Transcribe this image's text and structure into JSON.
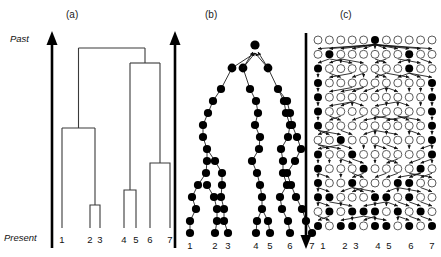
{
  "figure": {
    "background_color": "#ffffff",
    "width": 441,
    "height": 257
  },
  "axis": {
    "past_label": "Past",
    "present_label": "Present",
    "past_icon": "up-arrow-icon",
    "present_icon": "down-arrow-icon"
  },
  "panels": [
    {
      "id": "a",
      "label": "(a)",
      "type": "coalescent-tree",
      "arrow_direction": "up",
      "tip_labels": [
        "1",
        "2",
        "3",
        "4",
        "5",
        "6",
        "7"
      ]
    },
    {
      "id": "b",
      "label": "(b)",
      "type": "discrete-generation-genealogy",
      "arrow_direction": "up",
      "tip_labels": [
        "1",
        "2",
        "3",
        "4",
        "5",
        "6",
        "7"
      ]
    },
    {
      "id": "c",
      "label": "(c)",
      "type": "wright-fisher-population-grid",
      "arrow_direction": "down",
      "tip_labels": [
        "1",
        "2",
        "3",
        "4",
        "5",
        "6",
        "7"
      ],
      "grid_columns": 11,
      "grid_rows": 14
    }
  ],
  "colors": {
    "filled_node": "#000000",
    "open_node_fill": "#ffffff",
    "open_node_stroke": "#4a4a4a",
    "tree_line": "#3a3a3a",
    "axis": "#000000",
    "text": "#111111"
  },
  "chart_data": {
    "type": "diagram",
    "panel_a": {
      "description": "Coalescent tree with 7 sampled lineages drawn with square (rectangular) branches. Vertical axis is time from Present (bottom) to Past (top).",
      "tip_x": [
        62,
        90,
        100,
        124,
        136,
        150,
        170
      ],
      "tip_labels": [
        "1",
        "2",
        "3",
        "4",
        "5",
        "6",
        "7"
      ],
      "tip_y": 228,
      "coalescent_events": [
        {
          "name": "node_23",
          "children_x": [
            90,
            100
          ],
          "y": 205
        },
        {
          "name": "node_1_23",
          "children_x": [
            62,
            95
          ],
          "y": 128
        },
        {
          "name": "node_45",
          "children_x": [
            124,
            136
          ],
          "y": 190
        },
        {
          "name": "node_67",
          "children_x": [
            150,
            170
          ],
          "y": 163
        },
        {
          "name": "node_45_67",
          "children_x": [
            130,
            160
          ],
          "y": 63
        },
        {
          "name": "root",
          "children_x": [
            78.5,
            145
          ],
          "y": 48
        }
      ]
    },
    "panel_b": {
      "description": "Genealogy embedded in discrete generations: filled circles are ancestors of the sample, joined by arrows pointing back in time toward the root.",
      "rows": 14,
      "row_y": [
        40,
        54,
        68,
        82,
        96,
        110,
        124,
        138,
        152,
        166,
        180,
        194,
        208,
        233
      ],
      "tip_labels": [
        "1",
        "2",
        "3",
        "4",
        "5",
        "6",
        "7"
      ],
      "tip_x": [
        190,
        215,
        228,
        256,
        270,
        290,
        312
      ]
    },
    "panel_c": {
      "description": "Wright-Fisher population of 11 individuals per generation over 14 generations. Filled circles trace the genealogy of the 7 sampled lineages; open circles are non-ancestral individuals. Arrows run downward from parent to offspring.",
      "columns": 11,
      "rows": 14,
      "tip_labels": [
        "1",
        "2",
        "3",
        "4",
        "5",
        "6",
        "7"
      ],
      "sampled_columns": [
        0,
        2,
        3,
        5,
        6,
        8,
        10
      ]
    }
  }
}
